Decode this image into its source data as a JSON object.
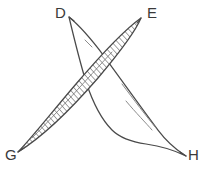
{
  "figure": {
    "background_color": "#ffffff",
    "stroke_color": "#4a4a4a",
    "hatch_color": "#555555",
    "labels": {
      "d": "D",
      "e": "E",
      "g": "G",
      "h": "H"
    },
    "shapes": [
      {
        "name": "hatched-leaf-GE",
        "from": "G",
        "to": "E",
        "filled": "hatched",
        "tip_start": [
          18,
          152
        ],
        "tip_end": [
          141,
          18
        ]
      },
      {
        "name": "outlined-leaf-DH",
        "from": "D",
        "to": "H",
        "filled": "none",
        "tip_start": [
          69,
          17
        ],
        "tip_end": [
          186,
          156
        ]
      }
    ],
    "vertices": [
      {
        "name": "D",
        "x": 69,
        "y": 17
      },
      {
        "name": "E",
        "x": 141,
        "y": 18
      },
      {
        "name": "G",
        "x": 18,
        "y": 152
      },
      {
        "name": "H",
        "x": 186,
        "y": 156
      }
    ]
  }
}
